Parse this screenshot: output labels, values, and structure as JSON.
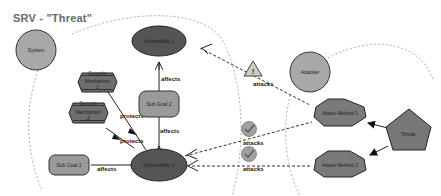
{
  "title": "SRV - \"Threat\"",
  "colors": {
    "circle_node": "#a8a8a8",
    "vulnerability": "#555555",
    "sub_goal": "#9a9a9a",
    "mechanism": "#6e6e6e",
    "attack_method": "#7a7a7a",
    "threat": "#777777",
    "check_badge": "#a0a0a0",
    "dashed_boundary": "#999999"
  },
  "nodes": {
    "system": "System",
    "vulnerability_1": "Vulnerability 1",
    "vulnerability_2": "Vulnerability 2",
    "sub_goal_1": "Sub Goal 1",
    "sub_goal_2": "Sub Goal 2",
    "security_mechanism_1": {
      "line1": "Security",
      "line2": "Mechanism",
      "line3": "1"
    },
    "security_mechanism_2": {
      "line1": "Security",
      "line2": "Mechanism",
      "line3": "2"
    },
    "attacker": "Attacker",
    "attack_method_1": "Attack Method 1",
    "attack_method_2": "Attack Method 2",
    "threat": "Threat"
  },
  "edges": {
    "v1_affects_sg2": "affects",
    "sg2_affects_v2": "affects",
    "v2_affects_sg1": "affects",
    "sm1_protects": "protects",
    "sm2_protects": "protects",
    "am1_attacks_v1": "attacks",
    "am1_attacks_v2": "attacks",
    "am2_attacks_v2": "attacks"
  },
  "badges": {
    "warning": "warning-triangle",
    "check_1": "check-circle",
    "check_2": "check-circle"
  }
}
